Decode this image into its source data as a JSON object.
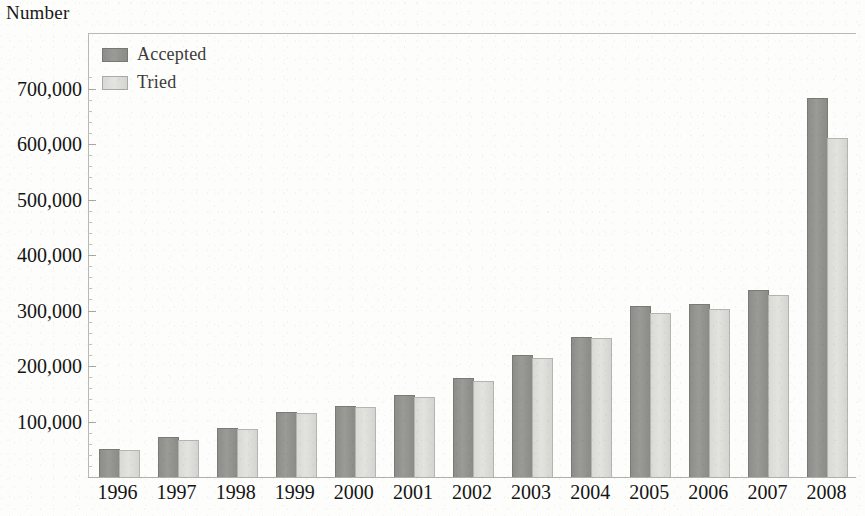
{
  "chart_data": {
    "type": "bar",
    "title": "",
    "ylabel": "Number",
    "xlabel": "",
    "categories": [
      "1996",
      "1997",
      "1998",
      "1999",
      "2000",
      "2001",
      "2002",
      "2003",
      "2004",
      "2005",
      "2006",
      "2007",
      "2008"
    ],
    "series": [
      {
        "name": "Accepted",
        "color": "#8f8f8c",
        "values": [
          50000,
          72000,
          88000,
          117000,
          128000,
          148000,
          178000,
          220000,
          253000,
          308000,
          311000,
          337000,
          683000
        ]
      },
      {
        "name": "Tried",
        "color": "#d9d9d5",
        "values": [
          48000,
          66000,
          87000,
          116000,
          126000,
          145000,
          173000,
          215000,
          251000,
          296000,
          303000,
          328000,
          610000
        ]
      }
    ],
    "ylim": [
      0,
      740000
    ],
    "yticks": [
      100000,
      200000,
      300000,
      400000,
      500000,
      600000,
      700000
    ],
    "ytick_labels": [
      "100,000",
      "200,000",
      "300,000",
      "400,000",
      "500,000",
      "600,000",
      "700,000"
    ],
    "grid": false,
    "legend_position": "top-left-inside"
  },
  "legend": {
    "items": [
      {
        "label": "Accepted",
        "swatch": "dark-gray-swatch"
      },
      {
        "label": "Tried",
        "swatch": "light-gray-swatch"
      }
    ]
  }
}
